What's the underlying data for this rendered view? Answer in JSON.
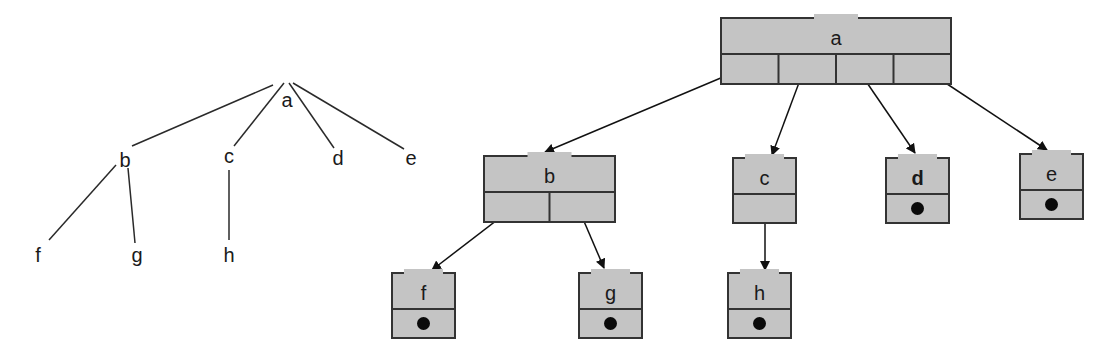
{
  "left_tree": {
    "nodes": [
      {
        "id": "a",
        "label": "a",
        "x": 287,
        "y": 107
      },
      {
        "id": "b",
        "label": "b",
        "x": 125,
        "y": 167
      },
      {
        "id": "c",
        "label": "c",
        "x": 229,
        "y": 163
      },
      {
        "id": "d",
        "label": "d",
        "x": 338,
        "y": 165
      },
      {
        "id": "e",
        "label": "e",
        "x": 411,
        "y": 165
      },
      {
        "id": "f",
        "label": "f",
        "x": 38,
        "y": 262
      },
      {
        "id": "g",
        "label": "g",
        "x": 137,
        "y": 262
      },
      {
        "id": "h",
        "label": "h",
        "x": 229,
        "y": 262
      }
    ],
    "edges": [
      {
        "x1": 273,
        "y1": 85,
        "x2": 132,
        "y2": 146
      },
      {
        "x1": 284,
        "y1": 83,
        "x2": 234,
        "y2": 146
      },
      {
        "x1": 289,
        "y1": 83,
        "x2": 334,
        "y2": 148
      },
      {
        "x1": 293,
        "y1": 83,
        "x2": 404,
        "y2": 149
      },
      {
        "x1": 116,
        "y1": 165,
        "x2": 49,
        "y2": 240
      },
      {
        "x1": 128,
        "y1": 168,
        "x2": 135,
        "y2": 243
      },
      {
        "x1": 229,
        "y1": 170,
        "x2": 229,
        "y2": 240
      }
    ]
  },
  "right_tree": {
    "nodes": [
      {
        "id": "a",
        "label": "a",
        "x": 721,
        "y": 18,
        "w": 230,
        "h": 66,
        "slots": 4,
        "leaf": false
      },
      {
        "id": "b",
        "label": "b",
        "x": 484,
        "y": 156,
        "w": 131,
        "h": 66,
        "slots": 2,
        "leaf": false
      },
      {
        "id": "c",
        "label": "c",
        "x": 733,
        "y": 158,
        "w": 63,
        "h": 65,
        "slots": 1,
        "leaf": false
      },
      {
        "id": "d",
        "label": "d",
        "x": 886,
        "y": 158,
        "w": 63,
        "h": 65,
        "slots": 1,
        "leaf": true,
        "bold": true
      },
      {
        "id": "e",
        "label": "e",
        "x": 1020,
        "y": 154,
        "w": 63,
        "h": 65,
        "slots": 1,
        "leaf": true
      },
      {
        "id": "f",
        "label": "f",
        "x": 392,
        "y": 273,
        "w": 63,
        "h": 65,
        "slots": 1,
        "leaf": true
      },
      {
        "id": "g",
        "label": "g",
        "x": 579,
        "y": 273,
        "w": 63,
        "h": 65,
        "slots": 1,
        "leaf": true
      },
      {
        "id": "h",
        "label": "h",
        "x": 728,
        "y": 273,
        "w": 63,
        "h": 65,
        "slots": 1,
        "leaf": true
      }
    ],
    "arrows": [
      {
        "x1": 735,
        "y1": 72,
        "x2": 545,
        "y2": 152
      },
      {
        "x1": 803,
        "y1": 72,
        "x2": 772,
        "y2": 155
      },
      {
        "x1": 861,
        "y1": 74,
        "x2": 915,
        "y2": 153
      },
      {
        "x1": 926,
        "y1": 70,
        "x2": 1047,
        "y2": 150
      },
      {
        "x1": 510,
        "y1": 210,
        "x2": 432,
        "y2": 270
      },
      {
        "x1": 580,
        "y1": 212,
        "x2": 604,
        "y2": 268
      },
      {
        "x1": 765,
        "y1": 211,
        "x2": 765,
        "y2": 270
      }
    ]
  },
  "colors": {
    "node_fill": "#c4c4c4",
    "stroke": "#333333",
    "text": "#1a1a1a"
  }
}
